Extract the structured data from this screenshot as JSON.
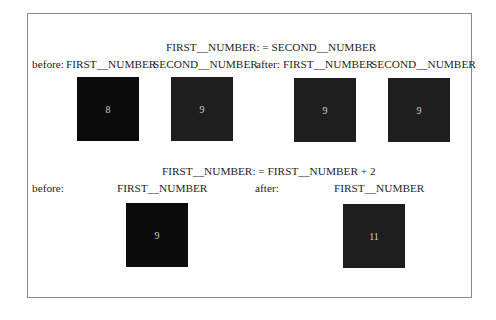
{
  "diagram": {
    "colors": {
      "frame": "#8a8a8a",
      "box_fill": "#1e1e1e",
      "box_fill_dark": "#0b0b0b",
      "box_text": "#cfcfcf"
    },
    "assignment1": {
      "statement": "FIRST__NUMBER: = SECOND__NUMBER",
      "before_label": "before:",
      "after_label": "after:",
      "before": [
        {
          "name": "FIRST__NUMBER",
          "value": "8"
        },
        {
          "name": "SECOND__NUMBER",
          "value": "9"
        }
      ],
      "after": [
        {
          "name": "FIRST__NUMBER",
          "value": "9"
        },
        {
          "name": "SECOND__NUMBER",
          "value": "9"
        }
      ]
    },
    "assignment2": {
      "statement": "FIRST__NUMBER: = FIRST__NUMBER + 2",
      "before_label": "before:",
      "after_label": "after:",
      "before": [
        {
          "name": "FIRST__NUMBER",
          "value": "9"
        }
      ],
      "after": [
        {
          "name": "FIRST__NUMBER",
          "value": "11"
        }
      ]
    }
  }
}
